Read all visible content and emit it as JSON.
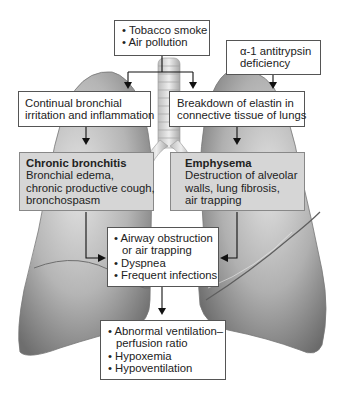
{
  "diagram": {
    "type": "flowchart",
    "nodes": {
      "causes": {
        "bullets": [
          "Tobacco smoke",
          "Air pollution"
        ]
      },
      "aat": {
        "lines": [
          "α-1 antitrypsin",
          "deficiency"
        ]
      },
      "irritation": {
        "lines": [
          "Continual bronchial",
          "irritation and inflammation"
        ]
      },
      "elastin": {
        "lines": [
          "Breakdown of elastin in",
          "connective tissue of lungs"
        ]
      },
      "bronchitis": {
        "title": "Chronic bronchitis",
        "lines": [
          "Bronchial edema,",
          "chronic productive cough,",
          "bronchospasm"
        ]
      },
      "emphysema": {
        "title": "Emphysema",
        "lines": [
          "Destruction of alveolar",
          "walls, lung fibrosis,",
          "air trapping"
        ]
      },
      "obstruction": {
        "bullet1": "Airway obstruction",
        "bullet1_cont": "or air trapping",
        "bullet2": "Dyspnea",
        "bullet3": "Frequent infections"
      },
      "outcomes": {
        "bullet1": "Abnormal ventilation–",
        "bullet1_cont": "perfusion ratio",
        "bullet2": "Hypoxemia",
        "bullet3": "Hypoventilation"
      }
    },
    "edges": [
      [
        "causes",
        "irritation"
      ],
      [
        "causes",
        "elastin"
      ],
      [
        "aat",
        "elastin"
      ],
      [
        "irritation",
        "bronchitis"
      ],
      [
        "elastin",
        "emphysema"
      ],
      [
        "bronchitis",
        "obstruction"
      ],
      [
        "emphysema",
        "obstruction"
      ],
      [
        "obstruction",
        "outcomes"
      ]
    ],
    "colors": {
      "box_fill": "#ffffff",
      "highlight_fill": "#d6d6d6",
      "arrow": "#111111",
      "lung_shade": "#9a9a9a"
    }
  }
}
